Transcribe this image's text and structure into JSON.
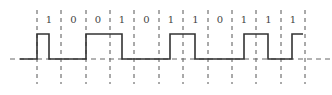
{
  "diagram": {
    "type": "digital-waveform",
    "bits": [
      "1",
      "0",
      "0",
      "1",
      "0",
      "1",
      "1",
      "0",
      "1",
      "1",
      "1"
    ],
    "boundaries_x": [
      37,
      61,
      86,
      110,
      134,
      159,
      183,
      208,
      232,
      256,
      281,
      305
    ],
    "baseline_y": 59,
    "high_y": 34,
    "high_segments": [
      [
        37,
        49
      ],
      [
        86,
        122
      ],
      [
        170,
        195
      ],
      [
        244,
        268
      ],
      [
        292,
        303
      ]
    ],
    "colors": {
      "line": "#333333",
      "dash": "#555555"
    }
  }
}
